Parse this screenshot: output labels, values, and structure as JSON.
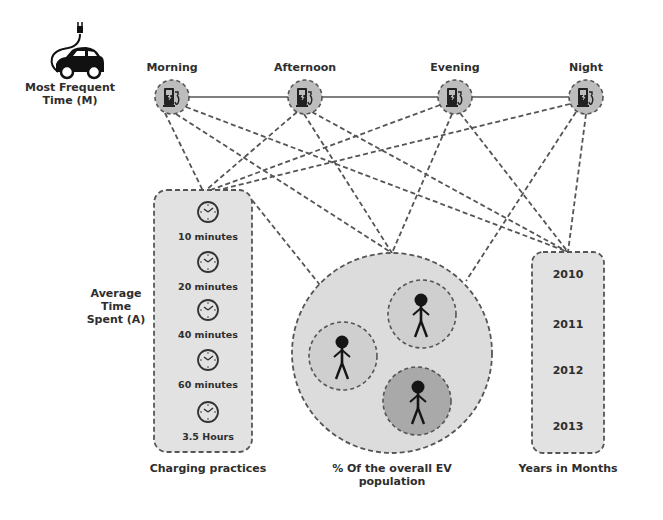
{
  "legend": {
    "icon": "ev-car-plug-icon",
    "label_line1": "Most Frequent",
    "label_line2": "Time (M)"
  },
  "times": [
    {
      "label": "Morning",
      "icon": "charging-station-icon"
    },
    {
      "label": "Afternoon",
      "icon": "charging-station-icon"
    },
    {
      "label": "Evening",
      "icon": "charging-station-icon"
    },
    {
      "label": "Night",
      "icon": "charging-station-icon"
    }
  ],
  "average_time": {
    "label_line1": "Average",
    "label_line2": "Time",
    "label_line3": "Spent (A)"
  },
  "charging_practices": {
    "title": "Charging practices",
    "items": [
      {
        "label": "10 minutes",
        "icon": "clock-icon"
      },
      {
        "label": "20 minutes",
        "icon": "clock-icon"
      },
      {
        "label": "40 minutes",
        "icon": "clock-icon"
      },
      {
        "label": "60 minutes",
        "icon": "clock-icon"
      },
      {
        "label": "3.5 Hours",
        "icon": "clock-icon"
      }
    ]
  },
  "population": {
    "title_line1": "% Of the overall EV",
    "title_line2": "population",
    "groups": [
      {
        "icon": "person-icon",
        "shade": "#cfcfcf"
      },
      {
        "icon": "person-icon",
        "shade": "#cfcfcf"
      },
      {
        "icon": "person-icon",
        "shade": "#a9a9a9"
      }
    ]
  },
  "years": {
    "title": "Years in Months",
    "items": [
      "2010",
      "2011",
      "2012",
      "2013"
    ]
  },
  "colors": {
    "node_fill": "#bdbdbd",
    "box_fill": "#e2e2e2",
    "dash": "#555555",
    "text": "#2e2e2e"
  }
}
